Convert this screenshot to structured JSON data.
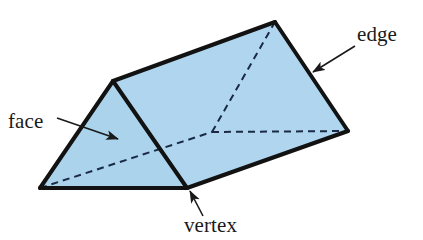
{
  "figure": {
    "shape_name": "triangular-prism",
    "background_color": "#ffffff",
    "face_fill_color": "#AFD6EE",
    "face_fill_color_front": "#ABD3EC",
    "outline_color": "#121212",
    "hidden_edge_color": "#1b2a44",
    "outline_width_px": 4,
    "hidden_edge_width_px": 2,
    "hidden_edge_dash": "7,5",
    "vertices": {
      "front_apex": {
        "x": 113,
        "y": 81
      },
      "back_apex": {
        "x": 275,
        "y": 22
      },
      "front_bottom_left": {
        "x": 40,
        "y": 188
      },
      "front_bottom_right": {
        "x": 187,
        "y": 188
      },
      "back_bottom_right": {
        "x": 348,
        "y": 131
      },
      "hidden_back_bottom_left": {
        "x": 212,
        "y": 132
      }
    },
    "faces": [
      {
        "name": "front-triangular-face",
        "points": "113,81 40,188 187,188"
      },
      {
        "name": "top-rectangular-face",
        "points": "113,81 275,22 348,131 187,188"
      }
    ],
    "visible_edges": [
      {
        "name": "edge-front-apex-to-front-bottom-left",
        "x1": 113,
        "y1": 81,
        "x2": 40,
        "y2": 188
      },
      {
        "name": "edge-front-apex-to-front-bottom-right",
        "x1": 113,
        "y1": 81,
        "x2": 187,
        "y2": 188
      },
      {
        "name": "edge-front-bottom-left-to-front-bottom-right",
        "x1": 40,
        "y1": 188,
        "x2": 187,
        "y2": 188
      },
      {
        "name": "edge-front-apex-to-back-apex",
        "x1": 113,
        "y1": 81,
        "x2": 275,
        "y2": 22
      },
      {
        "name": "edge-back-apex-to-back-bottom-right",
        "x1": 275,
        "y1": 22,
        "x2": 348,
        "y2": 131
      },
      {
        "name": "edge-front-bottom-right-to-back-bottom-right",
        "x1": 187,
        "y1": 188,
        "x2": 348,
        "y2": 131
      }
    ],
    "hidden_edges": [
      {
        "name": "hidden-edge-front-bottom-left-to-hidden-vertex",
        "x1": 40,
        "y1": 188,
        "x2": 212,
        "y2": 132
      },
      {
        "name": "hidden-edge-hidden-vertex-to-back-bottom-right",
        "x1": 212,
        "y1": 132,
        "x2": 348,
        "y2": 131
      },
      {
        "name": "hidden-edge-hidden-vertex-to-back-apex",
        "x1": 212,
        "y1": 132,
        "x2": 275,
        "y2": 22
      }
    ]
  },
  "annotations": [
    {
      "id": "face",
      "label": "face",
      "label_x": 8,
      "label_y": 128,
      "leader_x1": 57,
      "leader_y1": 118,
      "leader_x2": 118,
      "leader_y2": 139,
      "arrow_angle_deg": 19
    },
    {
      "id": "edge",
      "label": "edge",
      "label_x": 357,
      "label_y": 41,
      "leader_x1": 355,
      "leader_y1": 46,
      "leader_x2": 313,
      "leader_y2": 72,
      "arrow_angle_deg": 148
    },
    {
      "id": "vertex",
      "label": "vertex",
      "label_x": 184,
      "label_y": 232,
      "leader_x1": 203,
      "leader_y1": 216,
      "leader_x2": 190,
      "leader_y2": 191,
      "arrow_angle_deg": 243
    }
  ]
}
